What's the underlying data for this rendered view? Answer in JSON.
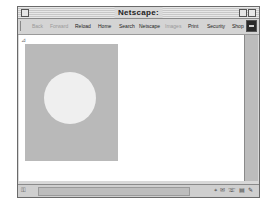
{
  "window": {
    "title": "Netscape:"
  },
  "toolbar": {
    "buttons": [
      {
        "label": "Back",
        "enabled": false
      },
      {
        "label": "Forward",
        "enabled": false
      },
      {
        "label": "Reload",
        "enabled": true
      },
      {
        "label": "Home",
        "enabled": true
      },
      {
        "label": "Search",
        "enabled": true
      },
      {
        "label": "Netscape",
        "enabled": true
      },
      {
        "label": "Images",
        "enabled": false
      },
      {
        "label": "Print",
        "enabled": true
      },
      {
        "label": "Security",
        "enabled": true
      },
      {
        "label": "Shop",
        "enabled": true
      }
    ]
  },
  "content": {
    "image_bg_color": "#b9b9b9",
    "circle_color": "#efefef"
  },
  "statusbar": {
    "lock_glyph": "⚿",
    "icons": [
      "⌖",
      "✉",
      "☏",
      "▤",
      "✎"
    ]
  },
  "colors": {
    "window_chrome": "#d8d8d8",
    "content_bg": "#ffffff"
  }
}
